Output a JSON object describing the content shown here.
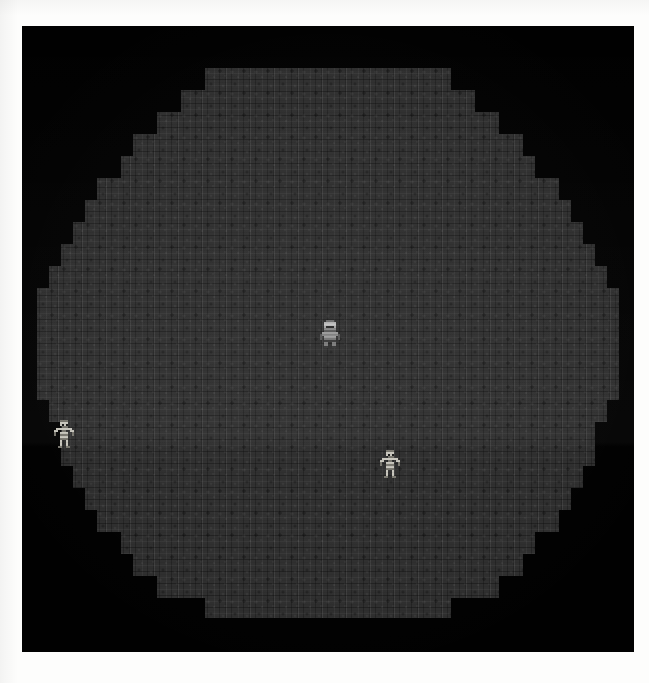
{
  "app": {
    "title": "Dungeon Cavern",
    "view_label": "game-viewport",
    "canvas_background": "#010101",
    "page_background": "#fdfdfc"
  },
  "viewport": {
    "x": 22,
    "y": 26,
    "width": 612,
    "height": 626
  },
  "level": {
    "name": "cavern-room",
    "shape": "stair-stepped-octagon",
    "tile_size": 12,
    "floor_color": "#2e2e2e",
    "floor_texture": "cobblestone-brick",
    "wall_color": "#010101",
    "lighting_band_y": 445,
    "rows": [
      {
        "y": 42,
        "h": 22,
        "x": 183,
        "w": 246
      },
      {
        "y": 64,
        "h": 22,
        "x": 159,
        "w": 294
      },
      {
        "y": 86,
        "h": 22,
        "x": 135,
        "w": 342
      },
      {
        "y": 108,
        "h": 22,
        "x": 111,
        "w": 390
      },
      {
        "y": 130,
        "h": 22,
        "x": 99,
        "w": 414
      },
      {
        "y": 152,
        "h": 22,
        "x": 75,
        "w": 462
      },
      {
        "y": 174,
        "h": 22,
        "x": 63,
        "w": 486
      },
      {
        "y": 196,
        "h": 22,
        "x": 51,
        "w": 510
      },
      {
        "y": 218,
        "h": 22,
        "x": 39,
        "w": 534
      },
      {
        "y": 240,
        "h": 22,
        "x": 27,
        "w": 558
      },
      {
        "y": 262,
        "h": 112,
        "x": 15,
        "w": 582
      },
      {
        "y": 374,
        "h": 22,
        "x": 27,
        "w": 558
      },
      {
        "y": 396,
        "h": 22,
        "x": 39,
        "w": 534
      },
      {
        "y": 418,
        "h": 22,
        "x": 39,
        "w": 534
      },
      {
        "y": 440,
        "h": 22,
        "x": 51,
        "w": 510
      },
      {
        "y": 462,
        "h": 22,
        "x": 63,
        "w": 486
      },
      {
        "y": 484,
        "h": 22,
        "x": 75,
        "w": 462
      },
      {
        "y": 506,
        "h": 22,
        "x": 99,
        "w": 414
      },
      {
        "y": 528,
        "h": 22,
        "x": 111,
        "w": 390
      },
      {
        "y": 550,
        "h": 22,
        "x": 135,
        "w": 342
      },
      {
        "y": 572,
        "h": 20,
        "x": 183,
        "w": 246
      }
    ]
  },
  "entities": {
    "player": {
      "name": "player-knight",
      "label": "Hero",
      "x": 298,
      "y": 292,
      "width": 20,
      "height": 30,
      "facing": "down",
      "colors": {
        "helmet": "#b9b9b9",
        "helmet_shadow": "#6e6e6e",
        "armor": "#8d8d8d",
        "armor_dark": "#4a4a4a",
        "outline": "#202020"
      }
    },
    "enemies": [
      {
        "name": "skeleton-1",
        "label": "Skeleton",
        "x": 32,
        "y": 394,
        "width": 20,
        "height": 28,
        "colors": {
          "bone": "#c8c6bd",
          "bone_shadow": "#79776f",
          "outline": "#1a1a1a"
        }
      },
      {
        "name": "skeleton-2",
        "label": "Skeleton",
        "x": 358,
        "y": 424,
        "width": 20,
        "height": 28,
        "colors": {
          "bone": "#c8c6bd",
          "bone_shadow": "#79776f",
          "outline": "#1a1a1a"
        }
      }
    ]
  },
  "hud": {
    "visible": false,
    "items": []
  }
}
